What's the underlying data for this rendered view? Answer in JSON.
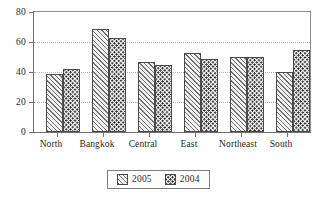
{
  "chart_data": {
    "type": "bar",
    "title": "",
    "subtitle": "",
    "xlabel": "",
    "ylabel": "",
    "categories": [
      "North",
      "Bangkok",
      "Central",
      "East",
      "Northeast",
      "South"
    ],
    "series": [
      {
        "name": "2005",
        "values": [
          39,
          69,
          47,
          53,
          50,
          40
        ],
        "pattern": "diagonal-hatch"
      },
      {
        "name": "2004",
        "values": [
          42,
          63,
          45,
          49,
          50,
          55
        ],
        "pattern": "dotted"
      }
    ],
    "ylim": [
      0,
      80
    ],
    "yticks": [
      0,
      20,
      40,
      60,
      80
    ],
    "ytick_labels": [
      "0",
      "20",
      "40",
      "60",
      "80"
    ],
    "grid": true,
    "grid_axis": "y",
    "grid_style": "dotted",
    "legend": {
      "position": "bottom-center",
      "entries": [
        "2005",
        "2004"
      ],
      "boxed": true
    },
    "colors": {
      "series_2005_fill": "#f2f2f2",
      "series_2005_hatch": "#737373",
      "series_2004_fill": "#fbfbfb",
      "series_2004_dots": "#2b2b2b",
      "bar_outline": "#4a4a4a",
      "axis": "#6e6e6e",
      "gridline": "#b4b4b4",
      "background": "#ffffff",
      "text": "#1f1f1f"
    }
  }
}
